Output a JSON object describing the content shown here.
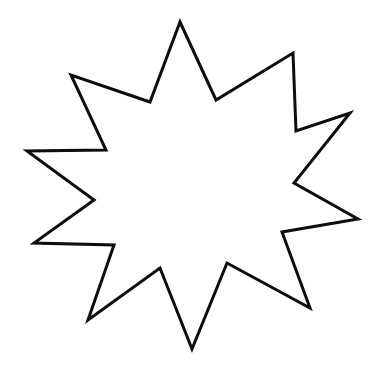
{
  "document": {
    "title": "Star Outline",
    "type": "line-drawing",
    "description": "Ten-pointed star outline coloring page",
    "background_color": "#ffffff",
    "canvas": {
      "width": 379,
      "height": 371
    }
  },
  "shape": {
    "name": "ten-pointed-star",
    "label": "Ten Pointed Star",
    "stroke_color": "#0d0d0d",
    "fill_color": "#ffffff",
    "stroke_width": 3,
    "point_count": 10,
    "center": {
      "x": 192,
      "y": 186
    },
    "outer_points": [
      {
        "x": 180,
        "y": 22
      },
      {
        "x": 293,
        "y": 53
      },
      {
        "x": 350,
        "y": 113
      },
      {
        "x": 358,
        "y": 219
      },
      {
        "x": 310,
        "y": 308
      },
      {
        "x": 192,
        "y": 349
      },
      {
        "x": 88,
        "y": 320
      },
      {
        "x": 34,
        "y": 243
      },
      {
        "x": 27,
        "y": 151
      },
      {
        "x": 71,
        "y": 75
      }
    ],
    "inner_points": [
      {
        "x": 216,
        "y": 100
      },
      {
        "x": 296,
        "y": 131
      },
      {
        "x": 294,
        "y": 183
      },
      {
        "x": 282,
        "y": 232
      },
      {
        "x": 227,
        "y": 263
      },
      {
        "x": 160,
        "y": 268
      },
      {
        "x": 114,
        "y": 245
      },
      {
        "x": 94,
        "y": 200
      },
      {
        "x": 106,
        "y": 150
      },
      {
        "x": 150,
        "y": 102
      }
    ],
    "path_d": "M 180 22 L 216 100 L 293 53 L 296 131 L 350 113 L 294 183 L 358 219 L 282 232 L 310 308 L 227 263 L 192 349 L 160 268 L 88 320 L 114 245 L 34 243 L 94 200 L 27 151 L 106 150 L 71 75 L 150 102 Z"
  }
}
